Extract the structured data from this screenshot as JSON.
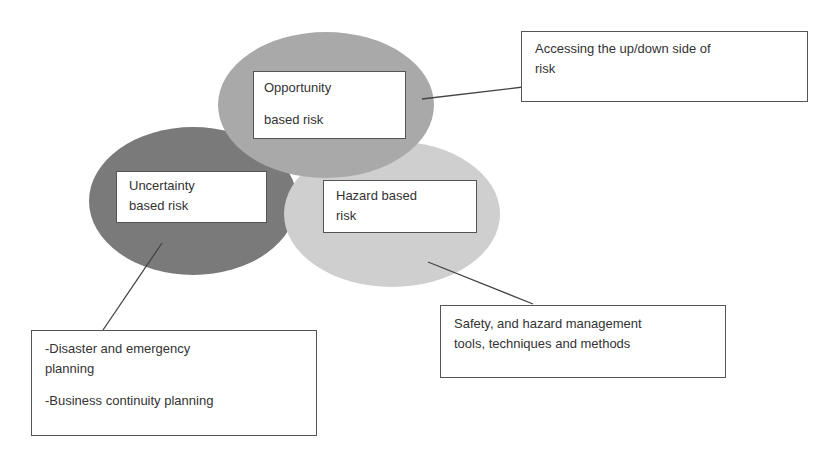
{
  "diagram": {
    "circles": [
      {
        "id": "opportunity",
        "lines": [
          "Opportunity",
          "based risk"
        ],
        "fill": "#a9a9a9"
      },
      {
        "id": "uncertainty",
        "lines": [
          "Uncertainty",
          "based risk"
        ],
        "fill": "#7a7a7a"
      },
      {
        "id": "hazard",
        "lines": [
          "Hazard based",
          "risk"
        ],
        "fill": "#cfcfcf"
      }
    ],
    "callouts": {
      "opportunity": {
        "lines": [
          "Accessing the up/down side of",
          "risk"
        ]
      },
      "hazard": {
        "lines": [
          "Safety, and hazard management",
          "tools, techniques and methods"
        ]
      },
      "uncertainty": {
        "items": [
          "-Disaster and emergency",
          "planning",
          "-Business continuity planning"
        ]
      }
    }
  }
}
